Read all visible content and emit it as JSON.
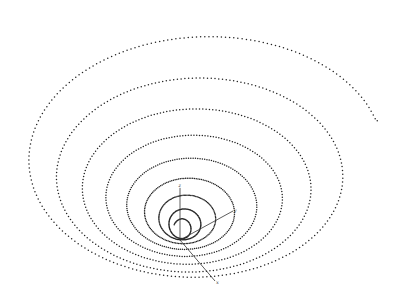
{
  "chart_data": {
    "type": "scatter",
    "title": "",
    "axes": {
      "origin": [
        180,
        240
      ],
      "x": {
        "label": "x",
        "end": [
          215,
          281
        ]
      },
      "y": {
        "label": "y",
        "end": [
          233,
          211
        ]
      },
      "z": {
        "label": "z",
        "end": [
          180,
          188
        ]
      }
    },
    "grid": false,
    "legend": null,
    "spiral": {
      "turns": 8.4,
      "start_angle_deg": 8,
      "end_point": [
        376,
        138
      ],
      "outer": {
        "cx": 198,
        "cy": 138,
        "rx": 181,
        "ry": 124
      },
      "inner": {
        "cx": 181,
        "cy": 230,
        "rx": 8,
        "ry": 10
      },
      "dot_spacing_px": 4.2,
      "dot_radius": 0.75
    },
    "loops_approx": [
      {
        "left": 17,
        "top": 14,
        "right": 376,
        "bottom": 262
      },
      {
        "left": 65,
        "top": 73,
        "right": 320,
        "bottom": 258
      },
      {
        "left": 97,
        "top": 117,
        "right": 280,
        "bottom": 254
      },
      {
        "left": 117,
        "top": 150,
        "right": 253,
        "bottom": 250
      },
      {
        "left": 137,
        "top": 175,
        "right": 233,
        "bottom": 246
      },
      {
        "left": 150,
        "top": 188,
        "right": 220,
        "bottom": 244
      },
      {
        "left": 158,
        "top": 197,
        "right": 210,
        "bottom": 242
      },
      {
        "left": 165,
        "top": 212,
        "right": 200,
        "bottom": 241
      }
    ]
  },
  "labels": {
    "x": "x",
    "y": "y",
    "z": "z"
  }
}
